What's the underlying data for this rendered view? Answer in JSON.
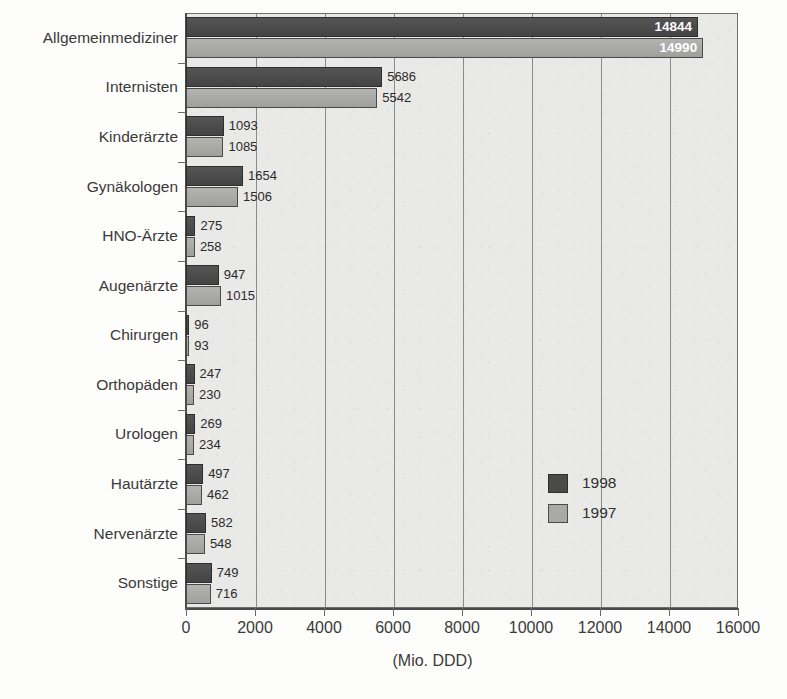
{
  "chart_data": {
    "type": "bar",
    "orientation": "horizontal",
    "title": "",
    "xlabel": "(Mio. DDD)",
    "ylabel": "",
    "xlim": [
      0,
      16000
    ],
    "xticks": [
      0,
      2000,
      4000,
      6000,
      8000,
      10000,
      12000,
      14000,
      16000
    ],
    "xtick_labels": [
      "0",
      "2000",
      "4000",
      "6000",
      "8000",
      "10000",
      "12000",
      "14000",
      "16000"
    ],
    "grid": true,
    "grid_axis": "x",
    "legend_position": "inside-right",
    "categories": [
      "Allgemeinmediziner",
      "Internisten",
      "Kinderärzte",
      "Gynäkologen",
      "HNO-Ärzte",
      "Augenärzte",
      "Chirurgen",
      "Orthopäden",
      "Urologen",
      "Hautärzte",
      "Nervenärzte",
      "Sonstige"
    ],
    "series": [
      {
        "name": "1998",
        "color": "#4a4a4a",
        "values": [
          14844,
          5686,
          1093,
          1654,
          275,
          947,
          96,
          247,
          269,
          497,
          582,
          749
        ]
      },
      {
        "name": "1997",
        "color": "#a9a9a6",
        "values": [
          14990,
          5542,
          1085,
          1506,
          258,
          1015,
          93,
          230,
          234,
          462,
          548,
          716
        ]
      }
    ]
  },
  "legend": {
    "entries": [
      {
        "label": "1998",
        "swatch": "dark-gray"
      },
      {
        "label": "1997",
        "swatch": "light-gray"
      }
    ]
  },
  "axis": {
    "x_title": "(Mio. DDD)"
  }
}
